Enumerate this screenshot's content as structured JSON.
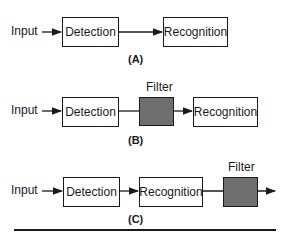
{
  "diagrams": [
    {
      "caption": "(A)",
      "input": "Input",
      "blocks": [
        "Detection",
        "Recognition"
      ]
    },
    {
      "caption": "(B)",
      "input": "Input",
      "blocks": [
        "Detection",
        "Filter",
        "Recognition"
      ],
      "filter_label": "Filter"
    },
    {
      "caption": "(C)",
      "input": "Input",
      "blocks": [
        "Detection",
        "Recognition",
        "Filter"
      ],
      "filter_label": "Filter"
    }
  ],
  "colors": {
    "line": "#1a1a1a",
    "filter_fill": "#6e6e6e"
  }
}
